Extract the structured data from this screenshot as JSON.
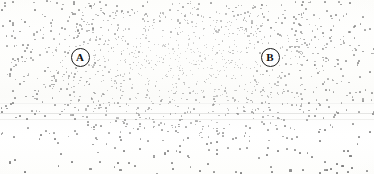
{
  "figure": {
    "background_color": "#fdfdfc",
    "dot_color": "#7d7d7d",
    "marker_stroke_color": "#1e1e1e",
    "marker_fill_color": "#ffffff",
    "width": 374,
    "height": 174
  },
  "markers": [
    {
      "id": "A",
      "label": "A",
      "x": 80,
      "y": 57,
      "diameter": 19,
      "font_size": 11
    },
    {
      "id": "B",
      "label": "B",
      "x": 270,
      "y": 57,
      "diameter": 19,
      "font_size": 11
    }
  ],
  "chart_data": {
    "type": "scatter",
    "title": "",
    "subtitle": "",
    "xlabel": "",
    "ylabel": "",
    "xlim": [
      0,
      374
    ],
    "ylim": [
      0,
      174
    ],
    "grid": false,
    "legend": "none",
    "annotations": [
      {
        "text": "A",
        "x": 80,
        "y": 57,
        "style": "circled-letter"
      },
      {
        "text": "B",
        "x": 270,
        "y": 57,
        "style": "circled-letter"
      }
    ],
    "density_model": {
      "description": "Radially decaying stipple density; dots are smallest and lightest at the core and become larger, darker and sparser toward the periphery.",
      "peak_center": [
        185,
        60
      ],
      "peak_radius_x": 120,
      "peak_radius_y": 52,
      "total_dots": 1450,
      "core_dot_size_px": 1,
      "edge_dot_size_px": 2.2,
      "core_opacity": 0.34,
      "edge_opacity": 0.92
    },
    "series": [
      {
        "name": "stipple-density",
        "points_count": 1450,
        "seed": 20240617
      }
    ]
  }
}
